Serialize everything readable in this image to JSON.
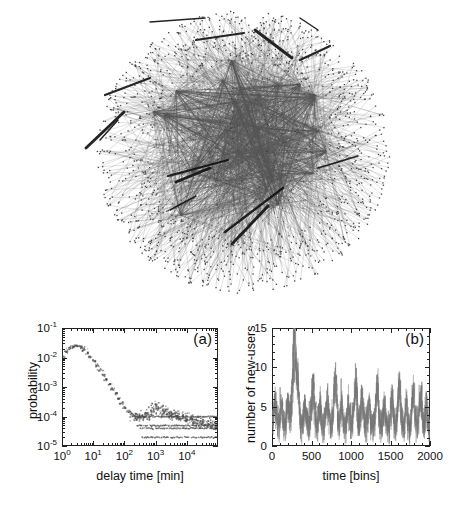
{
  "figure": {
    "width": 458,
    "height": 511,
    "background": "#ffffff",
    "ink_color": "#222222"
  },
  "network": {
    "caption_name": "user-interaction-network",
    "description": "dense circular radial network graph of users",
    "center_x": 243,
    "center_y": 152,
    "radius_x": 148,
    "radius_y": 143,
    "node_count": 1750,
    "hub_count": 34,
    "thick_edge_count": 14,
    "node_color": "#3a3a3a",
    "edge_color": "#555555",
    "thick_edge_color": "#111111"
  },
  "panels": [
    {
      "tag": "(a)",
      "name": "delay-time-distribution"
    },
    {
      "tag": "(b)",
      "name": "new-users-time-series"
    }
  ],
  "chart_data": [
    {
      "type": "scatter",
      "name": "panel-a",
      "tag": "(a)",
      "title": "",
      "xlabel": "delay time  [min]",
      "ylabel": "probability",
      "xscale": "log",
      "yscale": "log",
      "xlim": [
        1,
        100000
      ],
      "ylim": [
        1e-05,
        0.1
      ],
      "grid": false,
      "xticks": [
        1,
        10,
        100,
        1000,
        10000
      ],
      "xticklabels": [
        "10&#8304;",
        "10&#185;",
        "10&#178;",
        "10&#179;",
        "10&#8308;"
      ],
      "xtick_exponents": [
        "0",
        "1",
        "2",
        "3",
        "4"
      ],
      "yticks": [
        0.1,
        0.01,
        0.001,
        0.0001,
        1e-05
      ],
      "ytick_exponents": [
        "-1",
        "-2",
        "-3",
        "-4",
        "-5"
      ],
      "marker": "square",
      "marker_color": "#4a4a4a",
      "x": [
        1.0,
        1.3,
        1.6,
        2.0,
        2.5,
        3.2,
        4.0,
        5.0,
        6.3,
        7.9,
        10.0,
        12.6,
        15.8,
        20.0,
        25.1,
        31.6,
        39.8,
        50.1,
        63.1,
        79.4,
        100.0,
        126.0,
        158.0,
        200.0,
        251.0,
        316.0,
        398.0,
        501.0,
        631.0,
        794.0,
        1000.0,
        1259.0,
        1585.0,
        1995.0,
        2512.0,
        3162.0,
        3981.0,
        5012.0,
        6310.0,
        7943.0,
        10000.0,
        12589.0,
        15849.0,
        19953.0,
        25119.0,
        31623.0,
        39811.0,
        50119.0,
        63096.0,
        79433.0
      ],
      "y": [
        0.011,
        0.016,
        0.021,
        0.024,
        0.026,
        0.025,
        0.023,
        0.019,
        0.015,
        0.011,
        0.008,
        0.0056,
        0.0039,
        0.0027,
        0.0019,
        0.0013,
        0.0009,
        0.00062,
        0.00043,
        0.0003,
        0.00021,
        0.00016,
        0.00013,
        0.00011,
        0.0001,
        0.0001,
        0.000105,
        0.000115,
        0.000135,
        0.00019,
        0.00026,
        0.0002,
        0.00015,
        0.00016,
        0.00013,
        0.000115,
        0.00011,
        0.000105,
        0.0001,
        9.5e-05,
        9e-05,
        8.5e-05,
        8e-05,
        7.5e-05,
        7e-05,
        6.6e-05,
        6.2e-05,
        5.8e-05,
        5.5e-05,
        5.2e-05
      ],
      "quantization_bands": [
        0.0001,
        5e-05,
        4e-05,
        2e-05
      ],
      "band_note": "discrete horizontal bands from integer counting statistics"
    },
    {
      "type": "line",
      "name": "panel-b",
      "tag": "(b)",
      "title": "",
      "xlabel": "time [bins]",
      "ylabel": "number of new-users",
      "xscale": "linear",
      "yscale": "linear",
      "xlim": [
        0,
        2000
      ],
      "ylim": [
        0,
        15
      ],
      "grid": false,
      "xticks": [
        0,
        500,
        1000,
        1500,
        2000
      ],
      "xticklabels": [
        "0",
        "500",
        "1000",
        "1500",
        "2000"
      ],
      "yticks": [
        0,
        5,
        10,
        15
      ],
      "yticklabels": [
        "0",
        "5",
        "10",
        "15"
      ],
      "line_color": "#7a7a7a",
      "baseline_mean": 2.2,
      "noise_amplitude": 1.9,
      "n_points": 2000,
      "bursts": [
        {
          "center": 40,
          "width": 26,
          "height": 3.2
        },
        {
          "center": 120,
          "width": 22,
          "height": 2.4
        },
        {
          "center": 200,
          "width": 24,
          "height": 3.0
        },
        {
          "center": 285,
          "width": 34,
          "height": 11.0
        },
        {
          "center": 330,
          "width": 20,
          "height": 4.2
        },
        {
          "center": 420,
          "width": 22,
          "height": 2.6
        },
        {
          "center": 520,
          "width": 26,
          "height": 5.0
        },
        {
          "center": 610,
          "width": 20,
          "height": 2.8
        },
        {
          "center": 700,
          "width": 24,
          "height": 3.4
        },
        {
          "center": 800,
          "width": 26,
          "height": 6.4
        },
        {
          "center": 880,
          "width": 20,
          "height": 3.0
        },
        {
          "center": 970,
          "width": 22,
          "height": 2.6
        },
        {
          "center": 1060,
          "width": 26,
          "height": 5.6
        },
        {
          "center": 1140,
          "width": 22,
          "height": 4.2
        },
        {
          "center": 1230,
          "width": 20,
          "height": 2.8
        },
        {
          "center": 1330,
          "width": 24,
          "height": 5.4
        },
        {
          "center": 1420,
          "width": 20,
          "height": 3.0
        },
        {
          "center": 1520,
          "width": 22,
          "height": 3.6
        },
        {
          "center": 1610,
          "width": 24,
          "height": 5.0
        },
        {
          "center": 1700,
          "width": 20,
          "height": 3.2
        },
        {
          "center": 1790,
          "width": 22,
          "height": 4.4
        },
        {
          "center": 1880,
          "width": 24,
          "height": 4.0
        },
        {
          "center": 1955,
          "width": 18,
          "height": 3.0
        }
      ]
    }
  ]
}
